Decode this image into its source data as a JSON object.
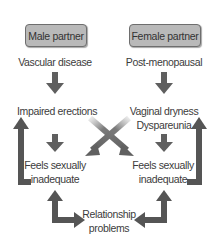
{
  "diagram": {
    "nodes": {
      "male_partner": "Male partner",
      "female_partner": "Female partner",
      "vascular_disease": "Vascular disease",
      "post_menopausal": "Post-menopausal",
      "impaired_erections": "Impaired erections",
      "vaginal_dryness": "Vaginal dryness",
      "dyspareunia": "Dyspareunia",
      "male_feels_line1": "Feels sexually",
      "male_feels_line2": "inadequate",
      "female_feels_line1": "Feels sexually",
      "female_feels_line2": "inadequate",
      "relationship_line1": "Relationship",
      "relationship_line2": "problems"
    },
    "edges": [
      {
        "from": "Male partner",
        "to": "Vascular disease",
        "style": "implicit"
      },
      {
        "from": "Vascular disease",
        "to": "Impaired erections",
        "style": "down-arrow"
      },
      {
        "from": "Impaired erections",
        "to": "Feels sexually inadequate (male)",
        "style": "down-arrow"
      },
      {
        "from": "Impaired erections",
        "to": "Feels sexually inadequate (female)",
        "style": "cross-arrow"
      },
      {
        "from": "Female partner",
        "to": "Post-menopausal",
        "style": "implicit"
      },
      {
        "from": "Post-menopausal",
        "to": "Vaginal dryness / Dyspareunia",
        "style": "down-arrow"
      },
      {
        "from": "Vaginal dryness / Dyspareunia",
        "to": "Feels sexually inadequate (female)",
        "style": "down-arrow"
      },
      {
        "from": "Vaginal dryness / Dyspareunia",
        "to": "Feels sexually inadequate (male)",
        "style": "cross-arrow"
      },
      {
        "from": "Feels sexually inadequate (male)",
        "to": "Impaired erections",
        "style": "feedback-loop-arrow"
      },
      {
        "from": "Feels sexually inadequate (female)",
        "to": "Vaginal dryness / Dyspareunia",
        "style": "feedback-loop-arrow"
      },
      {
        "from": "Feels sexually inadequate (male)",
        "to": "Relationship problems",
        "style": "bidirectional-arrow"
      },
      {
        "from": "Feels sexually inadequate (female)",
        "to": "Relationship problems",
        "style": "bidirectional-arrow"
      }
    ],
    "colors": {
      "box_fill": "#b9b9b9",
      "box_border": "#6e6e6e",
      "arrow": "#5f5f5f",
      "text": "#3c3c3c"
    }
  }
}
